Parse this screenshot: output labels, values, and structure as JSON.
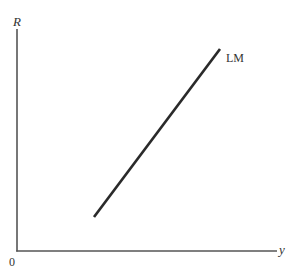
{
  "diagram": {
    "axes": {
      "y_label": "R",
      "x_label": "y",
      "origin_label": "0"
    },
    "curves": [
      {
        "label": "LM",
        "type": "line",
        "slope": "upward",
        "from": [
          94,
          217
        ],
        "to": [
          220,
          49
        ]
      }
    ],
    "colors": {
      "axis": "#555555",
      "curve": "#2a2a2a",
      "text": "#333333",
      "background": "#ffffff"
    }
  }
}
